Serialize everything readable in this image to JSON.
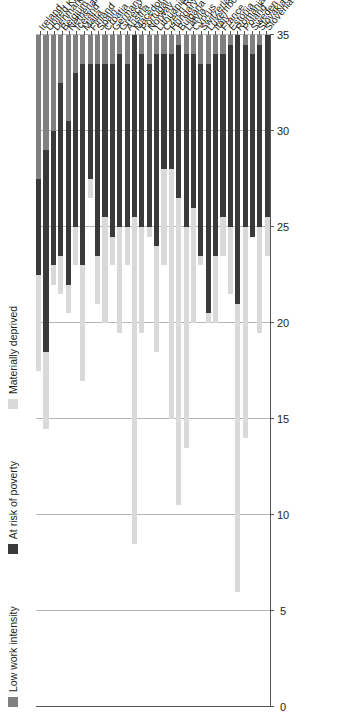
{
  "chart_data": {
    "type": "bar",
    "orientation": "horizontal-stacked",
    "title": "",
    "xlabel": "",
    "ylabel": "",
    "xlim": [
      0,
      35
    ],
    "xticks": [
      0,
      5,
      10,
      15,
      20,
      25,
      30,
      35
    ],
    "grid": true,
    "legend_position": "left",
    "legend": [
      "Low work intensity",
      "At risk of poverty",
      "Materially deprived"
    ],
    "colors": {
      "low_work_intensity": "#808080",
      "at_risk_of_poverty": "#3a3a3a",
      "materially_deprived": "#d9d9d9",
      "gridline": "#b7b7b7",
      "axis": "#555555",
      "text": "#231f20",
      "background": "#ffffff"
    },
    "categories": [
      "Ireland",
      "United Kingdom",
      "Denmark",
      "Belgium",
      "Netherlands",
      "Iceland",
      "Malta",
      "Finland",
      "Spain",
      "Croatia",
      "Germany",
      "Greece",
      "Austria",
      "Macedonia",
      "Portugal",
      "Norway",
      "Lithuania",
      "Czech Republic",
      "Hungary",
      "Bulgaria",
      "Latvia",
      "Cyprus",
      "Switzerland",
      "Luxembourg",
      "Italy",
      "France",
      "Estonia",
      "Romania",
      "Poland",
      "Sweden",
      "Slovakia",
      "Slovenia"
    ],
    "series": [
      {
        "name": "Low work intensity",
        "key": "low_work_intensity",
        "color": "#808080",
        "values": [
          7.5,
          6.0,
          5.0,
          2.5,
          4.5,
          2.0,
          1.5,
          1.5,
          1.5,
          1.5,
          1.5,
          1.0,
          1.5,
          0.0,
          1.0,
          1.5,
          1.0,
          1.0,
          1.0,
          0.5,
          1.0,
          1.0,
          1.5,
          1.5,
          1.0,
          1.0,
          0.5,
          0.0,
          0.5,
          1.0,
          0.5,
          0.0
        ]
      },
      {
        "name": "At risk of poverty",
        "key": "at_risk_of_poverty",
        "color": "#3a3a3a",
        "values": [
          5.0,
          10.5,
          7.0,
          9.0,
          8.5,
          8.0,
          10.5,
          6.0,
          10.0,
          8.0,
          9.0,
          9.0,
          8.5,
          9.5,
          9.0,
          8.5,
          10.0,
          6.0,
          6.0,
          8.0,
          9.0,
          8.0,
          10.0,
          13.0,
          10.5,
          8.5,
          9.5,
          14.0,
          9.5,
          9.5,
          9.5,
          9.5
        ]
      },
      {
        "name": "Materially deprived",
        "key": "materially_deprived",
        "color": "#d9d9d9",
        "values": [
          5.0,
          4.0,
          1.0,
          2.0,
          1.5,
          2.0,
          6.0,
          1.0,
          2.5,
          5.5,
          1.5,
          5.5,
          2.0,
          17.0,
          5.5,
          0.5,
          5.5,
          5.0,
          13.0,
          16.0,
          11.5,
          6.0,
          0.5,
          0.5,
          3.5,
          2.0,
          3.5,
          15.0,
          11.0,
          0.0,
          5.5,
          2.0
        ]
      }
    ]
  }
}
